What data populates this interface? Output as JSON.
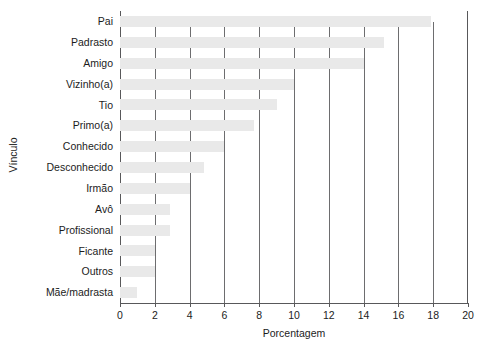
{
  "chart_data": {
    "type": "bar",
    "orientation": "horizontal",
    "title": "",
    "xlabel": "Porcentagem",
    "ylabel": "Vínculo",
    "xlim": [
      0,
      20
    ],
    "xticks": [
      0,
      2,
      4,
      6,
      8,
      10,
      12,
      14,
      16,
      18,
      20
    ],
    "grid": "vertical",
    "legend": "none",
    "bar_color": "#e9e9e9",
    "axis_color": "#58585a",
    "categories": [
      "Pai",
      "Padrasto",
      "Amigo",
      "Vizinho(a)",
      "Tio",
      "Primo(a)",
      "Conhecido",
      "Desconhecido",
      "Irmão",
      "Avô",
      "Profissional",
      "Ficante",
      "Outros",
      "Mãe/madrasta"
    ],
    "values": [
      17.9,
      15.2,
      14.0,
      10.0,
      9.0,
      7.7,
      6.0,
      4.8,
      4.0,
      2.9,
      2.9,
      2.0,
      2.0,
      1.0
    ]
  }
}
